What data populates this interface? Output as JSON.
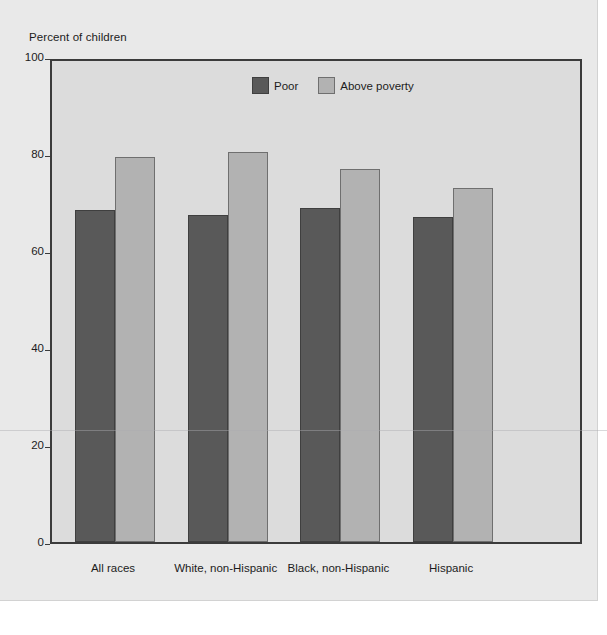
{
  "chart_data": {
    "type": "bar",
    "title": "",
    "ylabel": "Percent of children",
    "xlabel": "",
    "ylim": [
      0,
      100
    ],
    "yticks": [
      0,
      20,
      40,
      60,
      80,
      100
    ],
    "grid": false,
    "legend_position": "top-center",
    "categories": [
      "All races",
      "White, non-Hispanic",
      "Black, non-Hispanic",
      "Hispanic"
    ],
    "series": [
      {
        "name": "Poor",
        "color": "#595959",
        "values": [
          69,
          68,
          69.5,
          67.5
        ]
      },
      {
        "name": "Above poverty",
        "color": "#b2b2b2",
        "values": [
          80,
          81,
          77.5,
          73.5
        ]
      }
    ]
  },
  "axis": {
    "y_title": "Percent of children",
    "y_tick_labels": [
      "100",
      "80",
      "60",
      "40",
      "20",
      "0"
    ],
    "x_tick_labels": [
      "All races",
      "White, non-Hispanic",
      "Black, non-Hispanic",
      "Hispanic"
    ]
  },
  "legend": {
    "items": [
      {
        "label": "Poor",
        "color": "#595959"
      },
      {
        "label": "Above poverty",
        "color": "#b2b2b2"
      }
    ]
  },
  "colors": {
    "page_background": "#ffffff",
    "panel_background": "#e9e9e9",
    "plot_background": "#dcdcdc",
    "axis_line": "#3b3b3b",
    "poor_bar": "#595959",
    "above_poverty_bar": "#b2b2b2",
    "text": "#1c1c1c"
  }
}
